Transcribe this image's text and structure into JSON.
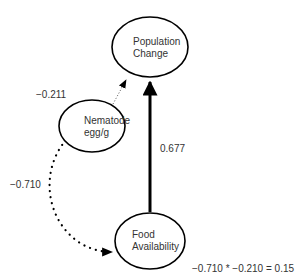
{
  "diagram": {
    "type": "path-diagram",
    "nodes": {
      "population_change": {
        "line1": "Population",
        "line2": "Change"
      },
      "nematode": {
        "line1": "Nematode",
        "line2": "egg/g"
      },
      "food_availability": {
        "line1": "Food",
        "line2": "Availability"
      }
    },
    "edges": {
      "nematode_to_population": {
        "from": "Nematode egg/g",
        "to": "Population Change",
        "coefficient": "−0.211",
        "style": "fine-dotted"
      },
      "food_to_population": {
        "from": "Food Availability",
        "to": "Population Change",
        "coefficient": "0.677",
        "style": "solid-thick"
      },
      "nematode_to_food": {
        "from": "Nematode egg/g",
        "to": "Food Availability",
        "coefficient": "−0.710",
        "style": "heavy-dotted-curved"
      }
    },
    "indirect_effect": "−0.710 * −0.210 = 0.15",
    "colors": {
      "stroke": "#000000",
      "text": "#333333",
      "background": "#ffffff"
    }
  }
}
